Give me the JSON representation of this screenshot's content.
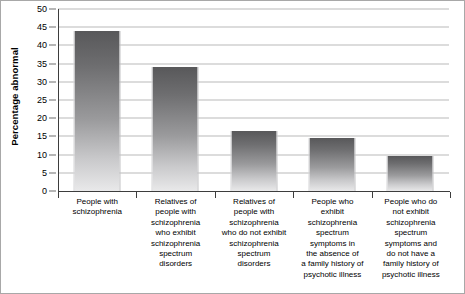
{
  "chart_data": {
    "type": "bar",
    "title": "",
    "xlabel": "",
    "ylabel": "Percentage abnormal",
    "ylim": [
      0,
      50
    ],
    "ytick_step": 5,
    "yticks": [
      50,
      45,
      40,
      35,
      30,
      25,
      20,
      15,
      10,
      5,
      0
    ],
    "grid": true,
    "legend": null,
    "categories": [
      "People with schizophrenia",
      "Relatives of people with schizophrenia who exhibit schizophrenia spectrum disorders",
      "Relatives of people with schizophrenia who do not exhibit schizophrenia spectrum disorders",
      "People who exhibit schizophrenia spectrum symptoms in the absence of a family history of psychotic illness",
      "People who do not exhibit schizophrenia spectrum symptoms and do not have a family history of psychotic illness"
    ],
    "category_lines": [
      [
        "People with",
        "schizophrenia"
      ],
      [
        "Relatives of",
        "people with",
        "schizophrenia",
        "who exhibit",
        "schizophrenia",
        "spectrum",
        "disorders"
      ],
      [
        "Relatives of",
        "people with",
        "schizophrenia",
        "who do not exhibit",
        "schizophrenia",
        "spectrum",
        "disorders"
      ],
      [
        "People who",
        "exhibit",
        "schizophrenia",
        "spectrum",
        "symptoms in",
        "the absence of",
        "a family history of",
        "psychotic illness"
      ],
      [
        "People who do",
        "not exhibit",
        "schizophrenia",
        "spectrum",
        "symptoms and",
        "do not have a",
        "family history of",
        "psychotic illness"
      ]
    ],
    "values": [
      44,
      34,
      16.5,
      14.5,
      9.5
    ],
    "colors": {
      "bar_top": "#58585a",
      "bar_bottom": "#e9e9ea",
      "gridline": "#b9b9b9",
      "axis": "#3d3d3d",
      "text": "#000000",
      "figure_border": "#a8a8a8"
    }
  }
}
